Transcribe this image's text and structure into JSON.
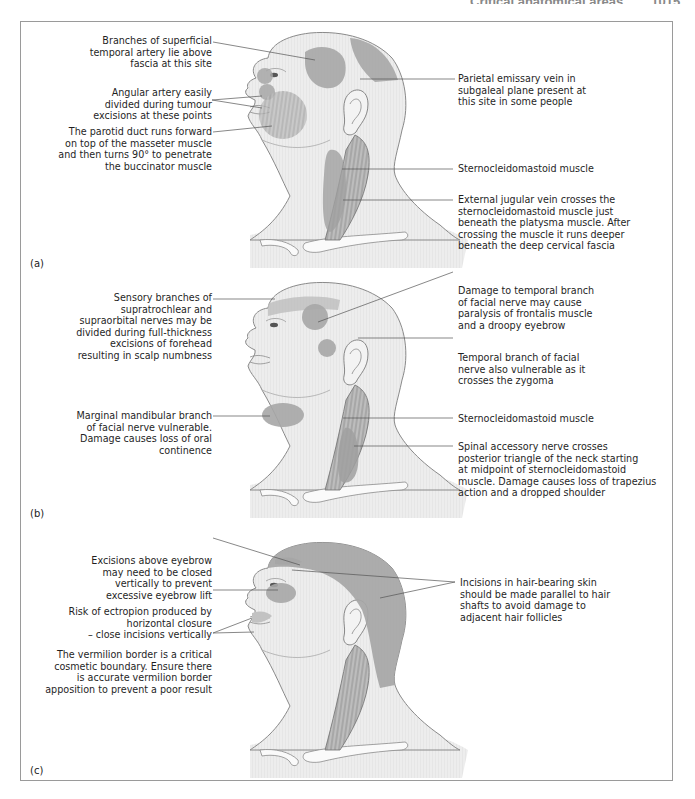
{
  "running_head": {
    "title": "Critical anatomical areas",
    "page": "1015"
  },
  "colors": {
    "skin": "#ececec",
    "skin_stroke": "#8a8a8a",
    "zone_fill": "#a9a9a9",
    "zone_dark": "#979797",
    "leader_line": "#555555",
    "frame": "#9a9a9a"
  },
  "panels": [
    {
      "id": "a",
      "label": "(a)",
      "left_annotations": [
        {
          "text": "Branches of superficial\ntemporal artery lie above\nfascia at this site"
        },
        {
          "text": "Angular artery easily\ndivided during tumour\nexcisions at these points"
        },
        {
          "text": "The parotid duct runs forward\non top of the masseter muscle\nand then turns 90° to penetrate\nthe buccinator muscle"
        }
      ],
      "right_annotations": [
        {
          "text": "Parietal emissary vein in\nsubgaleal plane present at\nthis site in some people"
        },
        {
          "text": "Sternocleidomastoid muscle"
        },
        {
          "text": "External jugular vein crosses the\nsternocleidomastoid muscle just\nbeneath the platysma muscle. After\ncrossing the muscle it runs deeper\nbeneath the deep cervical fascia"
        }
      ]
    },
    {
      "id": "b",
      "label": "(b)",
      "left_annotations": [
        {
          "text": "Sensory branches of\nsupratrochlear and\nsupraorbital nerves may be\ndivided during full-thickness\nexcisions of forehead\nresulting in scalp numbness"
        },
        {
          "text": "Marginal mandibular branch\nof facial nerve vulnerable.\nDamage causes loss of oral\ncontinence"
        }
      ],
      "right_annotations": [
        {
          "text": "Damage to temporal branch\nof facial nerve may cause\nparalysis of frontalis muscle\nand a droopy eyebrow"
        },
        {
          "text": "Temporal branch of facial\nnerve also vulnerable as it\ncrosses the zygoma"
        },
        {
          "text": "Sternocleidomastoid muscle"
        },
        {
          "text": "Spinal accessory nerve crosses\nposterior triangle of the neck starting\nat midpoint of sternocleidomastoid\nmuscle. Damage causes loss of trapezius\naction and a dropped shoulder"
        }
      ]
    },
    {
      "id": "c",
      "label": "(c)",
      "left_annotations": [
        {
          "text": "Excisions above eyebrow\nmay need to be closed\nvertically to prevent\nexcessive eyebrow lift"
        },
        {
          "text": "Risk of ectropion produced by\nhorizontal closure\n– close incisions vertically"
        },
        {
          "text": "The vermilion border is a critical\ncosmetic boundary. Ensure there\nis accurate vermilion border\napposition to prevent a poor result"
        }
      ],
      "right_annotations": [
        {
          "text": "Incisions in hair-bearing skin\nshould be made parallel to hair\nshafts to avoid damage to\nadjacent hair follicles"
        }
      ]
    }
  ]
}
